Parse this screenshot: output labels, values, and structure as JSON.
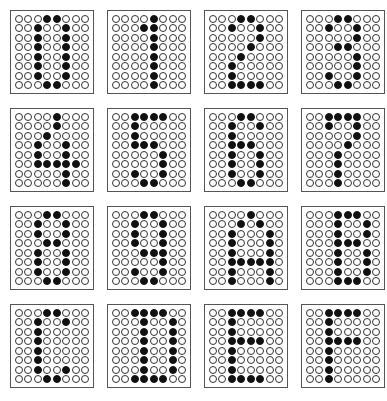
{
  "sheet": {
    "title": "8x8 dot-matrix character set",
    "columns": 4,
    "rows": 4,
    "colors": {
      "on": "#111111",
      "off": "#ffffff",
      "border": "#555555"
    },
    "glyphs": [
      {
        "char": "0",
        "rows": [
          "00011000",
          "00100100",
          "00100100",
          "00100100",
          "00100100",
          "00100100",
          "00100100",
          "00011000"
        ]
      },
      {
        "char": "1",
        "rows": [
          "00001000",
          "00011000",
          "00001000",
          "00001000",
          "00001000",
          "00001000",
          "00001000",
          "00001000"
        ]
      },
      {
        "char": "2",
        "rows": [
          "00011000",
          "00100100",
          "00000100",
          "00001000",
          "00010000",
          "00100000",
          "00100000",
          "00111100"
        ]
      },
      {
        "char": "3",
        "rows": [
          "00011000",
          "00100100",
          "00000100",
          "00011000",
          "00000100",
          "00000100",
          "00100100",
          "00011000"
        ]
      },
      {
        "char": "4",
        "rows": [
          "00001000",
          "00001000",
          "00010000",
          "00100100",
          "00100100",
          "00111110",
          "00000100",
          "00000100"
        ]
      },
      {
        "char": "5",
        "rows": [
          "00111100",
          "00100000",
          "00100000",
          "00111000",
          "00000100",
          "00000100",
          "00100100",
          "00011000"
        ]
      },
      {
        "char": "6",
        "rows": [
          "00011000",
          "00100100",
          "00100000",
          "00111000",
          "00100100",
          "00100100",
          "00100100",
          "00011000"
        ]
      },
      {
        "char": "7",
        "rows": [
          "00111100",
          "00100100",
          "00000100",
          "00001000",
          "00010000",
          "00010000",
          "00010000",
          "00010000"
        ]
      },
      {
        "char": "8",
        "rows": [
          "00011000",
          "00100100",
          "00100100",
          "00011000",
          "00100100",
          "00100100",
          "00100100",
          "00011000"
        ]
      },
      {
        "char": "9",
        "rows": [
          "00011000",
          "00100100",
          "00100100",
          "00100100",
          "00011100",
          "00000100",
          "00100100",
          "00011000"
        ]
      },
      {
        "char": "A",
        "rows": [
          "00001000",
          "00010100",
          "00100010",
          "00100010",
          "00100010",
          "00111110",
          "00100010",
          "00100010"
        ]
      },
      {
        "char": "B",
        "rows": [
          "00011100",
          "00010010",
          "00010010",
          "00011100",
          "00010010",
          "00010010",
          "00010010",
          "00011100"
        ]
      },
      {
        "char": "C",
        "rows": [
          "00011000",
          "00100100",
          "00100000",
          "00100000",
          "00100000",
          "00100000",
          "00100100",
          "00011000"
        ]
      },
      {
        "char": "D",
        "rows": [
          "00111100",
          "00010010",
          "00010010",
          "00010010",
          "00010010",
          "00010010",
          "00010010",
          "00111100"
        ]
      },
      {
        "char": "E",
        "rows": [
          "00111100",
          "00100000",
          "00100000",
          "00111100",
          "00100000",
          "00100000",
          "00100000",
          "00111100"
        ]
      },
      {
        "char": "F",
        "rows": [
          "00111100",
          "00100000",
          "00100000",
          "00111100",
          "00100000",
          "00100000",
          "00100000",
          "00100000"
        ]
      }
    ]
  }
}
